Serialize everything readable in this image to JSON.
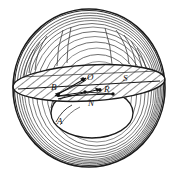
{
  "figure": {
    "kind": "hand-drawn geometric diagram",
    "background_color": "#ffffff",
    "ink_color": "#1a1a1a",
    "shading_color": "#555555",
    "hatch_color": "#2b2b2b",
    "sphere": {
      "name": "outer-sphere",
      "center_x": 89,
      "center_y": 88,
      "radius_x": 76,
      "radius_y": 79,
      "shading_arc_count": 14,
      "description": "large circle drawn with many concentric freehand shading arcs"
    },
    "disk": {
      "name": "hatched-equatorial-disk",
      "center_x": 89,
      "center_y": 83,
      "radius_x": 76,
      "radius_y": 18,
      "tilt_degrees": -3,
      "hatch_spacing": 6,
      "hatch_angle_degrees": 55,
      "description": "flat lens-shaped band seen nearly edge-on, filled with diagonal hatching"
    },
    "cavity": {
      "name": "inner-cavity-ellipse",
      "center_x": 92,
      "center_y": 113,
      "radius_x": 41,
      "radius_y": 25,
      "description": "open white bowl / inner ellipse below the disk"
    },
    "chord": {
      "name": "chord-line-B-to-S",
      "x1": 18,
      "y1": 88,
      "x2": 160,
      "y2": 80
    },
    "labels": [
      {
        "id": "B",
        "text": "B",
        "x": 51,
        "y": 83,
        "role": "left point on disk"
      },
      {
        "id": "O",
        "text": "O",
        "x": 87,
        "y": 73,
        "role": "center of sphere"
      },
      {
        "id": "S",
        "text": "S",
        "x": 123,
        "y": 74,
        "role": "right point on disk"
      },
      {
        "id": "R",
        "text": "R",
        "x": 104,
        "y": 85,
        "role": "point on lower chord"
      },
      {
        "id": "N",
        "text": "N",
        "x": 88,
        "y": 99,
        "role": "point below centre"
      },
      {
        "id": "A",
        "text": "A",
        "x": 57,
        "y": 117,
        "role": "point on cavity rim"
      }
    ],
    "vectors": [
      {
        "name": "arrow-toward-O",
        "x1": 55,
        "y1": 95,
        "x2": 86,
        "y2": 78
      },
      {
        "name": "arrow-toward-R",
        "x1": 58,
        "y1": 99,
        "x2": 101,
        "y2": 88
      }
    ],
    "nodes": [
      {
        "name": "node-O",
        "x": 83,
        "y": 79
      },
      {
        "name": "node-R",
        "x": 100,
        "y": 90
      },
      {
        "name": "node-N",
        "x": 85,
        "y": 92
      },
      {
        "name": "node-left",
        "x": 58,
        "y": 95
      },
      {
        "name": "node-cavity-right",
        "x": 113,
        "y": 94
      }
    ]
  }
}
